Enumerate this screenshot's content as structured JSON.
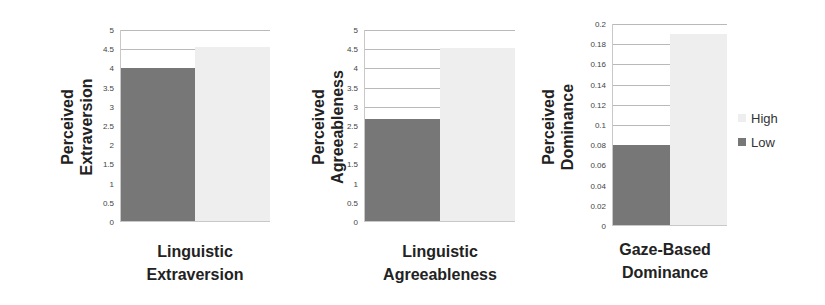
{
  "chart_data": [
    {
      "type": "bar",
      "title": "",
      "categories": [
        "Linguistic Extraversion"
      ],
      "xlabel": "Linguistic Extraversion",
      "ylabel": "Perceived Extraversion",
      "ylim": [
        0,
        5
      ],
      "yticks": [
        "0",
        "0.5",
        "1",
        "1.5",
        "2",
        "2.5",
        "3",
        "3.5",
        "4",
        "4.5",
        "5"
      ],
      "grid": true,
      "series": [
        {
          "name": "Low",
          "values": [
            4.0
          ],
          "color": "#777777"
        },
        {
          "name": "High",
          "values": [
            4.57
          ],
          "color": "#eeeeee"
        }
      ]
    },
    {
      "type": "bar",
      "title": "",
      "categories": [
        "Linguistic Agreeableness"
      ],
      "xlabel": "Linguistic Agreeableness",
      "ylabel": "Perceived Agreeableness",
      "ylim": [
        0,
        5
      ],
      "yticks": [
        "0",
        "0.5",
        "1",
        "1.5",
        "2",
        "2.5",
        "3",
        "3.5",
        "4",
        "4.5",
        "5"
      ],
      "grid": true,
      "series": [
        {
          "name": "Low",
          "values": [
            2.67
          ],
          "color": "#777777"
        },
        {
          "name": "High",
          "values": [
            4.53
          ],
          "color": "#eeeeee"
        }
      ]
    },
    {
      "type": "bar",
      "title": "",
      "categories": [
        "Gaze-Based Dominance"
      ],
      "xlabel": "Gaze-Based Dominance",
      "ylabel": "Perceived Dominance",
      "ylim": [
        0,
        0.2
      ],
      "yticks": [
        "0",
        "0.02",
        "0.04",
        "0.06",
        "0.08",
        "0.1",
        "0.12",
        "0.14",
        "0.16",
        "0.18",
        "0.2"
      ],
      "grid": true,
      "series": [
        {
          "name": "Low",
          "values": [
            0.08
          ],
          "color": "#777777"
        },
        {
          "name": "High",
          "values": [
            0.19
          ],
          "color": "#eeeeee"
        }
      ]
    }
  ],
  "legend": {
    "position": "right",
    "items": [
      {
        "label": "High",
        "color": "#eeeeee"
      },
      {
        "label": "Low",
        "color": "#777777"
      }
    ]
  },
  "panels": [
    {
      "ylabel_line1": "Perceived",
      "ylabel_line2": "Extraversion",
      "xlabel_line1": "Linguistic",
      "xlabel_line2": "Extraversion"
    },
    {
      "ylabel_line1": "Perceived",
      "ylabel_line2": "Agreeableness",
      "xlabel_line1": "Linguistic",
      "xlabel_line2": "Agreeableness"
    },
    {
      "ylabel_line1": "Perceived",
      "ylabel_line2": "Dominance",
      "xlabel_line1": "Gaze-Based",
      "xlabel_line2": "Dominance"
    }
  ]
}
